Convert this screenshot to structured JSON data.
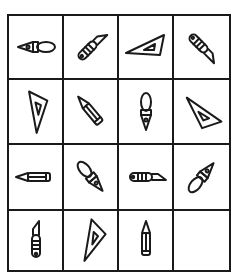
{
  "puzzle": {
    "rows": 4,
    "cols": 4,
    "cells": [
      {
        "icon": "fountain-pen",
        "rotation": 90
      },
      {
        "icon": "craft-knife",
        "rotation": 45
      },
      {
        "icon": "set-square",
        "rotation": 0
      },
      {
        "icon": "craft-knife",
        "rotation": 135
      },
      {
        "icon": "set-square",
        "rotation": 180
      },
      {
        "icon": "pencil",
        "rotation": -45
      },
      {
        "icon": "fountain-pen",
        "rotation": 180
      },
      {
        "icon": "set-square",
        "rotation": 135
      },
      {
        "icon": "pencil",
        "rotation": -90
      },
      {
        "icon": "fountain-pen",
        "rotation": 135
      },
      {
        "icon": "craft-knife",
        "rotation": 90
      },
      {
        "icon": "fountain-pen",
        "rotation": -135
      },
      {
        "icon": "craft-knife",
        "rotation": 0
      },
      {
        "icon": "set-square",
        "rotation": 45
      },
      {
        "icon": "pencil",
        "rotation": 0
      },
      {
        "icon": "empty",
        "rotation": 0
      }
    ]
  }
}
